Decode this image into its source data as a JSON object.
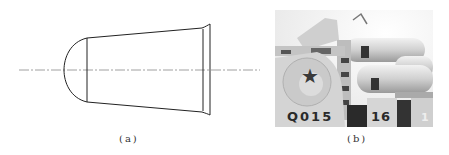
{
  "figure": {
    "panels": [
      {
        "id": "a",
        "caption": "(a)",
        "description": "Line drawing of a missile nose / launch-tube shape: hemispherical dome cap, tapered conical body, flared rim at the right, with a dash-dot center axis"
      },
      {
        "id": "b",
        "caption": "(b)",
        "description": "Grayscale photo of a naval missile launcher with red-star emblem, tubes and hull numbers",
        "markings": {
          "emblem": "★",
          "number_left": "Q015",
          "number_right": "16",
          "number_partial": "1"
        }
      }
    ]
  },
  "colors": {
    "line": "#222222",
    "axis": "#777777",
    "photo_light": "#e6e6e6",
    "photo_mid": "#bdbdbd",
    "photo_dark": "#2a2a2a"
  }
}
